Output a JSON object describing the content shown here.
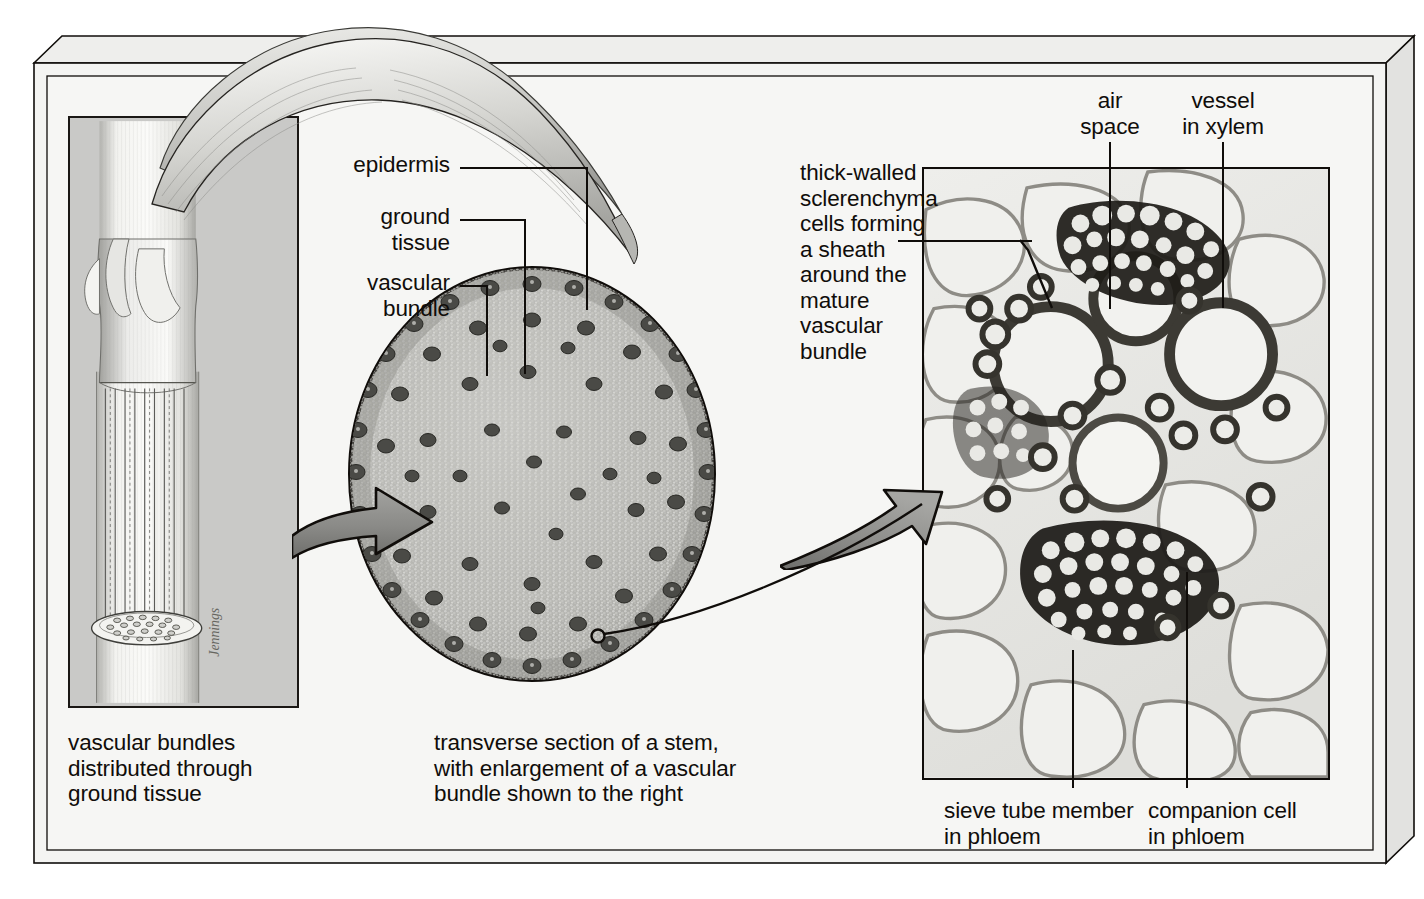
{
  "figure": {
    "background_color": "#f6f6f4",
    "frame_color": "#100d0a",
    "ink_color": "#100d0a"
  },
  "labels": {
    "epidermis": "epidermis",
    "ground_tissue": "ground\ntissue",
    "vascular_bundle": "vascular\nbundle",
    "thick_walled": "thick-walled\nsclerenchyma\ncells forming\na sheath\naround the\nmature\nvascular\nbundle",
    "air_space": "air\nspace",
    "vessel_in_xylem": "vessel\nin xylem",
    "sieve_tube_member": "sieve tube member\nin phloem",
    "companion_cell": "companion cell\nin phloem"
  },
  "captions": {
    "left": "vascular bundles\ndistributed through\nground tissue",
    "center": "transverse section of a stem,\nwith enlargement of a vascular\nbundle shown to the right"
  },
  "artist_signature": "Jennings",
  "panels": {
    "left_panel": {
      "name": "grass stem with leaf sheath",
      "background": "#c9c9c7",
      "stem_color": "#ededea",
      "bundle_line_color": "#5b5b58"
    },
    "center_panel": {
      "name": "transverse section of stem",
      "ground_tissue_color": "#b9b9b5",
      "rind_color": "#8d8d88",
      "bundle_color": "#3a3a37",
      "outline_color": "#100d0a"
    },
    "right_panel": {
      "name": "light micrograph of a vascular bundle",
      "cell_wall_dark": "#262420",
      "cell_lumen": "#efefec",
      "parenchyma_wall": "#8e8c86",
      "background": "#e8e8e6"
    }
  },
  "arrows": [
    {
      "name": "arrow-to-stem-section",
      "fill": "#8a8a87",
      "outline": "#100d0a"
    },
    {
      "name": "arrow-to-micrograph",
      "fill": "#8a8a87",
      "outline": "#100d0a"
    }
  ]
}
